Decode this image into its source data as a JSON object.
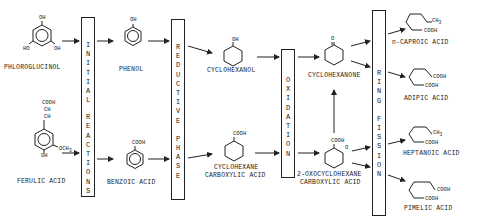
{
  "phases": [
    {
      "id": "initial",
      "words": [
        "INITIAL",
        "REACTIONS"
      ]
    },
    {
      "id": "reductive",
      "words": [
        "REDUCTIVE",
        "PHASE"
      ]
    },
    {
      "id": "oxidation",
      "words": [
        "OXIDATION"
      ]
    },
    {
      "id": "ring_fission",
      "words": [
        "RING",
        "FISSION"
      ]
    }
  ],
  "compounds": {
    "phloroglucinol": "PHLOROGLUCINOL",
    "ferulic_acid": "FERULIC ACID",
    "phenol": "PHENOL",
    "benzoic_acid": "BENZOIC ACID",
    "cyclohexanol": "CYCLOHEXANOL",
    "cyclohexane_carboxylic_acid_1": "CYCLOHEXANE",
    "cyclohexane_carboxylic_acid_2": "CARBOXYLIC ACID",
    "cyclohexanone": "CYCLOHEXANONE",
    "oxo_1": "2-OXOCYCLOHEXANE",
    "oxo_2": "CARBOXYLIC ACID",
    "n_caproic_acid": "n-CAPROIC ACID",
    "adipic_acid": "ADIPIC ACID",
    "heptanoic_acid": "HEPTANOIC ACID",
    "pimelic_acid": "PIMELIC ACID"
  },
  "groups": {
    "oh": "OH",
    "ho": "HO",
    "cooh": "COOH",
    "ch": "CH",
    "och3": "OCH",
    "sub3": "3",
    "ch3": "CH",
    "o": "O"
  }
}
